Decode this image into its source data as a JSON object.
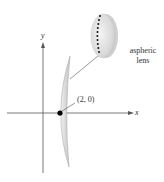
{
  "figure": {
    "axes": {
      "x_label": "x",
      "y_label": "y"
    },
    "point": {
      "label": "(2, 0)",
      "x": 2,
      "y": 0
    },
    "inset": {
      "caption_line1": "aspheric",
      "caption_line2": "lens"
    },
    "colors": {
      "axis": "#555555",
      "lens_fill": "#dedede",
      "lens_stroke": "#9a9a9a",
      "point": "#000000",
      "text": "#333333"
    }
  }
}
